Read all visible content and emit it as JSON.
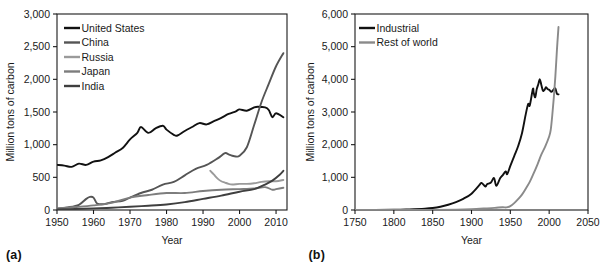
{
  "figure": {
    "panels": [
      {
        "tag": "(a)",
        "ylabel": "Million tons of carbon",
        "xlabel": "Year"
      },
      {
        "tag": "(b)",
        "ylabel": "Million tons of carbon",
        "xlabel": "Year"
      }
    ]
  },
  "colors": {
    "united_states": "#111111",
    "china": "#555555",
    "russia": "#9a9a9a",
    "japan": "#7d7d7d",
    "india": "#3f3f3f",
    "industrial": "#111111",
    "rest_of_world": "#8a8a8a",
    "axis": "#1a1a1a",
    "background": "#ffffff"
  },
  "chart_data": [
    {
      "type": "line",
      "title": "",
      "panel": "(a)",
      "xlabel": "Year",
      "ylabel": "Million tons of carbon",
      "xlim": [
        1950,
        2013
      ],
      "ylim": [
        0,
        3000
      ],
      "xticks": [
        1950,
        1960,
        1970,
        1980,
        1990,
        2000,
        2010
      ],
      "xtick_labels": [
        "1950",
        "1960",
        "1970",
        "1980",
        "1990",
        "2000",
        "2010"
      ],
      "yticks": [
        0,
        500,
        1000,
        1500,
        2000,
        2500,
        3000
      ],
      "ytick_labels": [
        "0",
        "500",
        "1,000",
        "1,500",
        "2,000",
        "2,500",
        "3,000"
      ],
      "grid": false,
      "legend_position": "upper left",
      "series": [
        {
          "name": "United States",
          "color": "#111111",
          "x": [
            1950,
            1952,
            1954,
            1956,
            1958,
            1960,
            1962,
            1964,
            1966,
            1968,
            1970,
            1972,
            1973,
            1975,
            1977,
            1979,
            1980,
            1982,
            1983,
            1985,
            1987,
            1989,
            1991,
            1993,
            1995,
            1997,
            1999,
            2000,
            2002,
            2004,
            2005,
            2007,
            2008,
            2009,
            2010,
            2012
          ],
          "values": [
            690,
            680,
            660,
            710,
            690,
            740,
            760,
            810,
            880,
            950,
            1080,
            1180,
            1270,
            1180,
            1250,
            1290,
            1230,
            1150,
            1140,
            1210,
            1270,
            1330,
            1310,
            1360,
            1410,
            1470,
            1510,
            1540,
            1520,
            1570,
            1580,
            1570,
            1530,
            1420,
            1480,
            1420
          ]
        },
        {
          "name": "China",
          "color": "#555555",
          "x": [
            1950,
            1953,
            1956,
            1958,
            1959,
            1960,
            1961,
            1963,
            1965,
            1968,
            1970,
            1973,
            1976,
            1979,
            1982,
            1985,
            1988,
            1991,
            1994,
            1996,
            1997,
            1998,
            1999,
            2000,
            2002,
            2004,
            2006,
            2008,
            2010,
            2012
          ],
          "values": [
            20,
            40,
            80,
            170,
            200,
            190,
            100,
            90,
            120,
            140,
            190,
            260,
            310,
            390,
            430,
            530,
            630,
            690,
            790,
            870,
            850,
            830,
            820,
            830,
            960,
            1300,
            1650,
            1930,
            2200,
            2400
          ]
        },
        {
          "name": "Russia",
          "color": "#9a9a9a",
          "x": [
            1992,
            1993,
            1994,
            1995,
            1996,
            1997,
            1998,
            2000,
            2002,
            2004,
            2006,
            2008,
            2010,
            2012
          ],
          "values": [
            600,
            540,
            480,
            440,
            420,
            400,
            390,
            400,
            400,
            410,
            430,
            440,
            440,
            460
          ]
        },
        {
          "name": "Japan",
          "color": "#7d7d7d",
          "x": [
            1950,
            1955,
            1960,
            1965,
            1970,
            1975,
            1980,
            1985,
            1990,
            1995,
            2000,
            2004,
            2007,
            2009,
            2010,
            2012
          ],
          "values": [
            25,
            45,
            70,
            110,
            190,
            230,
            260,
            260,
            290,
            310,
            320,
            330,
            350,
            310,
            320,
            340
          ]
        },
        {
          "name": "India",
          "color": "#3f3f3f",
          "x": [
            1950,
            1955,
            1960,
            1965,
            1970,
            1975,
            1980,
            1985,
            1990,
            1995,
            2000,
            2004,
            2007,
            2009,
            2011,
            2012
          ],
          "values": [
            10,
            15,
            25,
            35,
            50,
            65,
            85,
            120,
            170,
            220,
            280,
            320,
            390,
            450,
            540,
            600
          ]
        }
      ]
    },
    {
      "type": "line",
      "title": "",
      "panel": "(b)",
      "xlabel": "Year",
      "ylabel": "Million tons of carbon",
      "xlim": [
        1750,
        2050
      ],
      "ylim": [
        0,
        6000
      ],
      "xticks": [
        1750,
        1800,
        1850,
        1900,
        1950,
        2000,
        2050
      ],
      "xtick_labels": [
        "1750",
        "1800",
        "1850",
        "1900",
        "1950",
        "2000",
        "2050"
      ],
      "yticks": [
        0,
        1000,
        2000,
        3000,
        4000,
        5000,
        6000
      ],
      "ytick_labels": [
        "0",
        "1,000",
        "2,000",
        "3,000",
        "4,000",
        "5,000",
        "6,000"
      ],
      "grid": false,
      "legend_position": "upper left",
      "series": [
        {
          "name": "Industrial",
          "color": "#111111",
          "x": [
            1750,
            1800,
            1820,
            1840,
            1850,
            1860,
            1870,
            1880,
            1890,
            1900,
            1910,
            1913,
            1918,
            1920,
            1925,
            1929,
            1932,
            1937,
            1940,
            1944,
            1946,
            1950,
            1955,
            1960,
            1965,
            1970,
            1973,
            1975,
            1979,
            1980,
            1982,
            1984,
            1986,
            1988,
            1990,
            1992,
            1994,
            1996,
            1998,
            2000,
            2003,
            2006,
            2008,
            2010,
            2012
          ],
          "values": [
            3,
            8,
            20,
            40,
            60,
            100,
            160,
            240,
            350,
            500,
            760,
            830,
            720,
            790,
            840,
            980,
            740,
            980,
            1060,
            1180,
            1100,
            1350,
            1650,
            1950,
            2350,
            2950,
            3250,
            3200,
            3700,
            3600,
            3450,
            3700,
            3850,
            4000,
            3820,
            3650,
            3680,
            3760,
            3700,
            3680,
            3620,
            3700,
            3720,
            3560,
            3540
          ]
        },
        {
          "name": "Rest of world",
          "color": "#8a8a8a",
          "x": [
            1750,
            1800,
            1850,
            1880,
            1900,
            1920,
            1930,
            1940,
            1945,
            1950,
            1955,
            1960,
            1965,
            1970,
            1975,
            1980,
            1985,
            1990,
            1995,
            2000,
            2002,
            2004,
            2006,
            2008,
            2010,
            2012
          ],
          "values": [
            1,
            2,
            5,
            12,
            25,
            50,
            65,
            85,
            80,
            120,
            210,
            330,
            470,
            660,
            860,
            1120,
            1400,
            1700,
            1950,
            2250,
            2450,
            2900,
            3450,
            4100,
            4900,
            5600
          ]
        }
      ]
    }
  ],
  "legends": {
    "panel_a": [
      {
        "label": "United States",
        "color": "#111111"
      },
      {
        "label": "China",
        "color": "#555555"
      },
      {
        "label": "Russia",
        "color": "#9a9a9a"
      },
      {
        "label": "Japan",
        "color": "#7d7d7d"
      },
      {
        "label": "India",
        "color": "#3f3f3f"
      }
    ],
    "panel_b": [
      {
        "label": "Industrial",
        "color": "#111111"
      },
      {
        "label": "Rest of world",
        "color": "#8a8a8a"
      }
    ]
  }
}
